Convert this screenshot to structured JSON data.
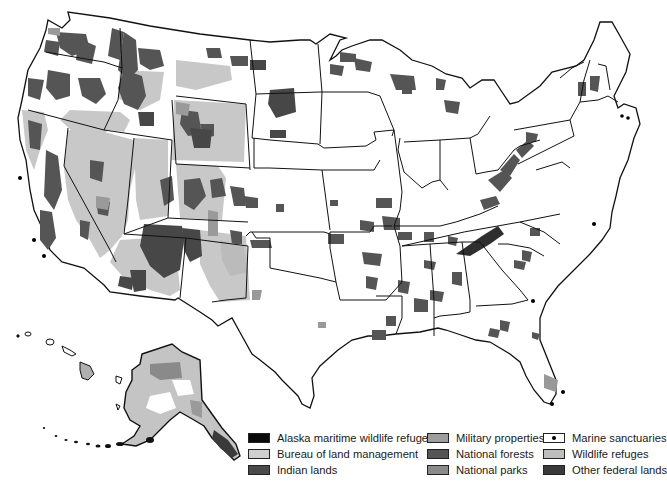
{
  "map": {
    "subject": "Federal lands of the United States",
    "colors": {
      "background": "#ffffff",
      "state_border": "#111111",
      "alaska_maritime_wildlife_refuge": "#0a0a0a",
      "bureau_of_land_management": "#c9c9c9",
      "indian_lands": "#4a4a4a",
      "military_properties": "#9a9a9a",
      "national_forests": "#555555",
      "national_parks": "#8e8e8e",
      "marine_sanctuaries": "#000000",
      "wildlife_refuges": "#b8b8b8",
      "other_federal_lands": "#3c3c3c"
    }
  },
  "legend": {
    "items": [
      {
        "label": "Alaska maritime wildlife refuge",
        "color": "#0a0a0a",
        "icon": "solid-swatch"
      },
      {
        "label": "Bureau of land management",
        "color": "#cfcfcf",
        "icon": "solid-swatch"
      },
      {
        "label": "Indian lands",
        "color": "#4a4a4a",
        "icon": "solid-swatch"
      },
      {
        "label": "Military properties",
        "color": "#9d9d9d",
        "icon": "solid-swatch"
      },
      {
        "label": "National forests",
        "color": "#555555",
        "icon": "solid-swatch"
      },
      {
        "label": "National parks",
        "color": "#8a8a8a",
        "icon": "solid-swatch"
      },
      {
        "label": "Marine sanctuaries",
        "color": "#ffffff",
        "icon": "dot-marker"
      },
      {
        "label": "Wildlife refuges",
        "color": "#bdbdbd",
        "icon": "solid-swatch"
      },
      {
        "label": "Other federal lands",
        "color": "#3a3a3a",
        "icon": "solid-swatch"
      }
    ]
  }
}
